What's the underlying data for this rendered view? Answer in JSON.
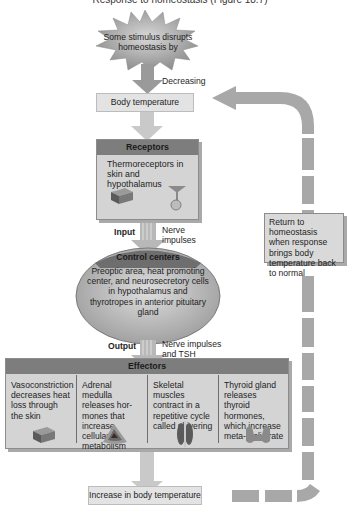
{
  "caption": {
    "top_partial": "Response to homeostasis (Figure 18.7)"
  },
  "stimulus": {
    "text": "Some stimulus disrupts homeostasis by"
  },
  "arrow_labels": {
    "decreasing": "Decreasing",
    "input": "Input",
    "input_detail": "Nerve impulses",
    "output": "Output",
    "output_detail": "Nerve impulses and TSH"
  },
  "controlled_condition": {
    "top": "Body temperature",
    "bottom": "Increase in body temperature"
  },
  "receptors": {
    "title": "Receptors",
    "text": "Thermoreceptors in skin and hypothalamus",
    "icons": [
      "skin-block-icon",
      "hypothalamus-neuron-icon"
    ]
  },
  "control_centers": {
    "title": "Control centers",
    "text": "Preoptic area, heat promoting center, and neurosecretory cells in hypothalamus and thyrotropes in anterior pituitary gland"
  },
  "effectors": {
    "title": "Effectors",
    "columns": [
      {
        "text": "Vasoconstriction decreases heat loss through the skin",
        "icon": "skin-block-icon"
      },
      {
        "text": "Adrenal medulla releases hor- mones that increase cellular metabolism",
        "icon": "adrenal-gland-icon"
      },
      {
        "text": "Skeletal muscles contract in a repetitive cycle called shivering",
        "icon": "skeletal-muscle-icon"
      },
      {
        "text": "Thyroid gland releases thyroid hormones, which increase meta- bolic rate",
        "icon": "thyroid-gland-icon"
      }
    ]
  },
  "feedback": {
    "text": "Return to homeostasis when response brings body temperature back to normal"
  },
  "colors": {
    "arrow": "#a8a8a8",
    "panel_header": "#7d7d7d",
    "panel_body": "#d4d4d4",
    "light_box": "#e3e3e3"
  }
}
